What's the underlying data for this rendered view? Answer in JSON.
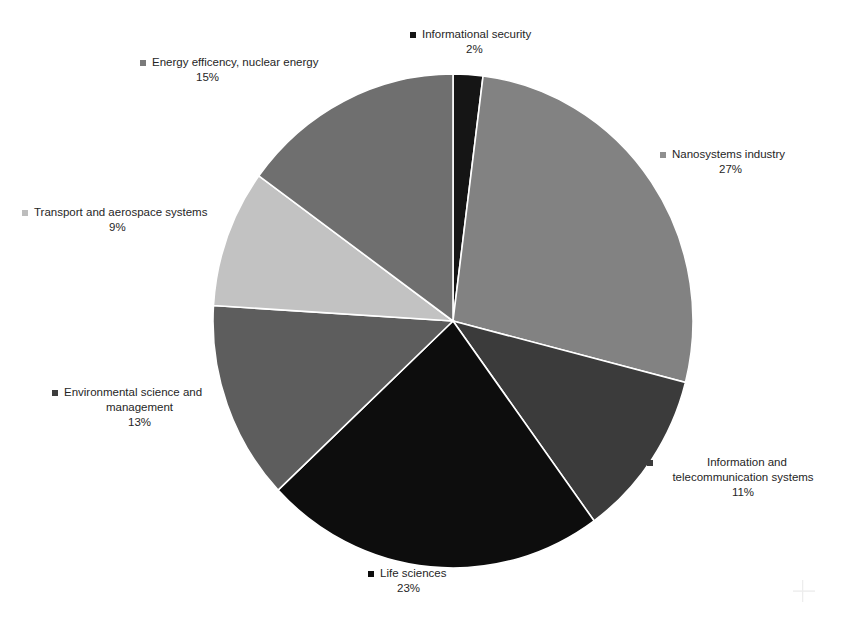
{
  "chart_data": {
    "type": "pie",
    "title": "",
    "subtitle": "",
    "xlabel": "",
    "ylabel": "",
    "legend_position": "around-slices",
    "grid": false,
    "unit": "%",
    "start_angle_deg": 0,
    "direction": "clockwise",
    "categories": [
      "Informational security",
      "Nanosystems industry",
      "Information and telecommunication systems",
      "Life sciences",
      "Environmental science and management",
      "Transport and aerospace systems",
      "Energy efficency, nuclear energy"
    ],
    "values": [
      2,
      27,
      11,
      23,
      13,
      9,
      15
    ],
    "slices": [
      {
        "id": "informational-security",
        "label": "Informational security",
        "label_lines": [
          "Informational security"
        ],
        "value": 2,
        "value_text": "2%",
        "color": "#151515",
        "marker_color": "#151515"
      },
      {
        "id": "nanosystems-industry",
        "label": "Nanosystems industry",
        "label_lines": [
          "Nanosystems industry"
        ],
        "value": 27,
        "value_text": "27%",
        "color": "#828282",
        "marker_color": "#8f8f8f"
      },
      {
        "id": "information-telecom",
        "label": "Information and telecommunication systems",
        "label_lines": [
          "Information and",
          "telecommunication systems"
        ],
        "value": 11,
        "value_text": "11%",
        "color": "#3b3b3b",
        "marker_color": "#3b3b3b"
      },
      {
        "id": "life-sciences",
        "label": "Life sciences",
        "label_lines": [
          "Life sciences"
        ],
        "value": 23,
        "value_text": "23%",
        "color": "#0d0d0d",
        "marker_color": "#0d0d0d"
      },
      {
        "id": "environmental-science",
        "label": "Environmental science and management",
        "label_lines": [
          "Environmental science and",
          "management"
        ],
        "value": 13,
        "value_text": "13%",
        "color": "#5d5d5d",
        "marker_color": "#3d3d3d"
      },
      {
        "id": "transport-aerospace",
        "label": "Transport and aerospace systems",
        "label_lines": [
          "Transport and aerospace systems"
        ],
        "value": 9,
        "value_text": "9%",
        "color": "#c2c2c2",
        "marker_color": "#bdbdbd"
      },
      {
        "id": "energy-efficiency",
        "label": "Energy efficency, nuclear energy",
        "label_lines": [
          "Energy efficency, nuclear energy"
        ],
        "value": 15,
        "value_text": "15%",
        "color": "#6f6f6f",
        "marker_color": "#7a7a7a"
      }
    ]
  },
  "labels": {
    "informational_security": {
      "text": "Informational security",
      "pct": "2%"
    },
    "energy_efficiency": {
      "text": "Energy efficency, nuclear energy",
      "pct": "15%"
    },
    "nanosystems_industry": {
      "text": "Nanosystems industry",
      "pct": "27%"
    },
    "transport_aerospace": {
      "text": "Transport and aerospace systems",
      "pct": "9%"
    },
    "environmental_science": {
      "line1": "Environmental science and",
      "line2": "management",
      "pct": "13%"
    },
    "information_telecom": {
      "line1": "Information and",
      "line2": "telecommunication systems",
      "pct": "11%"
    },
    "life_sciences": {
      "text": "Life sciences",
      "pct": "23%"
    }
  },
  "colors": {
    "background": "#ffffff",
    "text": "#262626",
    "slice_border": "#ffffff"
  }
}
